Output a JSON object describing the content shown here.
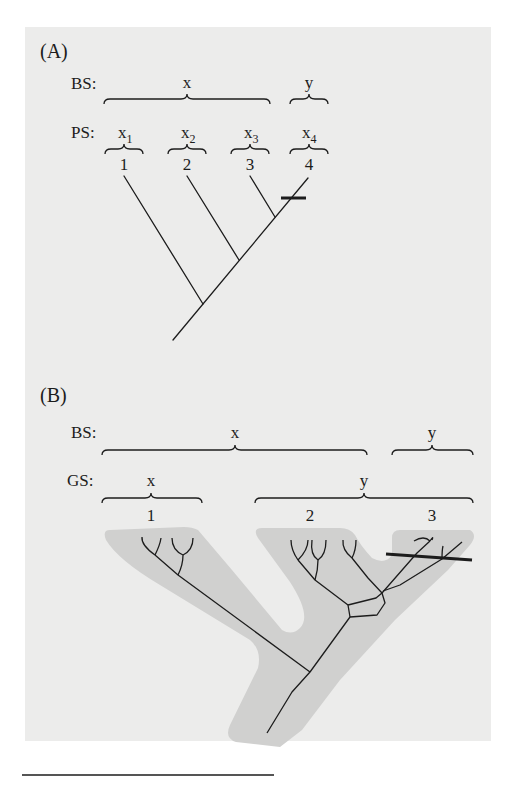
{
  "top_text_fragment": "· · · · · · ·",
  "panel_a": {
    "label": "(A)",
    "row1_label": "BS:",
    "row2_label": "PS:",
    "bs_groups": [
      "x",
      "y"
    ],
    "ps_groups": [
      {
        "base": "x",
        "sub": "1"
      },
      {
        "base": "x",
        "sub": "2"
      },
      {
        "base": "x",
        "sub": "3"
      },
      {
        "base": "x",
        "sub": "4"
      }
    ],
    "taxa": [
      "1",
      "2",
      "3",
      "4"
    ],
    "mark": "bar crossing lineage 4"
  },
  "panel_b": {
    "label": "(B)",
    "row1_label": "BS:",
    "row2_label": "GS:",
    "bs_groups": [
      "x",
      "y"
    ],
    "gs_groups": [
      "x",
      "y"
    ],
    "taxa": [
      "1",
      "2",
      "3"
    ],
    "mark": "bar crossing lineage 3"
  },
  "colors": {
    "background": "#ececeb",
    "species_tree_fill": "#d0d0cf",
    "line": "#1c1c1c"
  }
}
